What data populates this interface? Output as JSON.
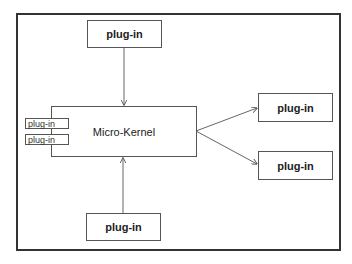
{
  "diagram": {
    "kernel": {
      "label": "Micro-Kernel"
    },
    "plugins": {
      "top": "plug-in",
      "bottom": "plug-in",
      "right_top": "plug-in",
      "right_bottom": "plug-in",
      "left_top": "plug-in",
      "left_bottom": "plug-in"
    },
    "edges": [
      {
        "from": "plugins.top",
        "to": "kernel",
        "direction": "down"
      },
      {
        "from": "plugins.bottom",
        "to": "kernel",
        "direction": "up"
      },
      {
        "from": "kernel",
        "to": "plugins.right_top"
      },
      {
        "from": "kernel",
        "to": "plugins.right_bottom"
      }
    ],
    "colors": {
      "stroke": "#555555",
      "frame": "#333333",
      "background": "#ffffff"
    }
  }
}
